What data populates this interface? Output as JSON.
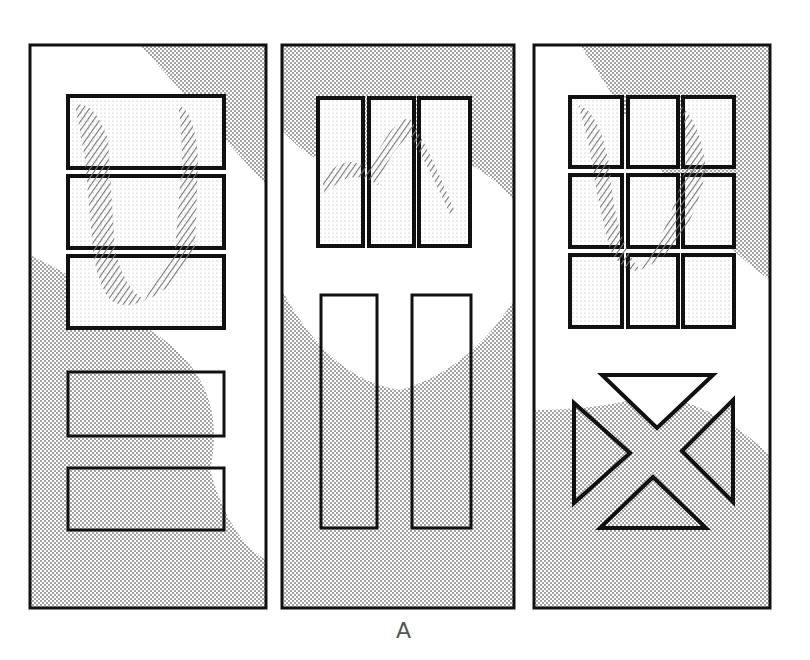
{
  "figure": {
    "caption": "A",
    "colors": {
      "stroke": "#111111",
      "dots": "#888888",
      "hatch": "#777777",
      "background": "#ffffff"
    }
  },
  "doors": [
    {
      "id": "left-door",
      "panels": [
        "3 horizontal glass lites (stacked)",
        "2 horizontal raised panels"
      ]
    },
    {
      "id": "center-door",
      "panels": [
        "3 vertical glass lites",
        "2 tall vertical raised panels"
      ]
    },
    {
      "id": "right-door",
      "panels": [
        "3x3 grid of glass lites",
        "4 triangular panels forming an X"
      ]
    }
  ]
}
